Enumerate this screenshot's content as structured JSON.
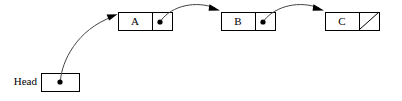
{
  "diagram": {
    "type": "linked-list",
    "colors": {
      "stroke": "#000000",
      "curve": "#444444",
      "background": "#ffffff",
      "dot": "#000000"
    },
    "head": {
      "label": "Head",
      "box": {
        "x": 41,
        "y": 73,
        "width": 38,
        "height": 18
      },
      "dot": {
        "cx": 60,
        "cy": 82,
        "r": 2.6
      },
      "label_pos": {
        "x": 37,
        "y": 82
      }
    },
    "nodes": [
      {
        "id": "node-a",
        "label": "A",
        "box": {
          "x": 118,
          "y": 12,
          "width": 54,
          "height": 18
        },
        "divider_x": 152,
        "data_label_pos": {
          "x": 135,
          "y": 21.5
        },
        "pointer": {
          "type": "dot",
          "cx": 160,
          "cy": 22,
          "r": 2.6
        }
      },
      {
        "id": "node-b",
        "label": "B",
        "box": {
          "x": 221,
          "y": 12,
          "width": 54,
          "height": 18
        },
        "divider_x": 255,
        "data_label_pos": {
          "x": 238,
          "y": 21.5
        },
        "pointer": {
          "type": "dot",
          "cx": 263,
          "cy": 22,
          "r": 2.6
        }
      },
      {
        "id": "node-c",
        "label": "C",
        "box": {
          "x": 325,
          "y": 12,
          "width": 54,
          "height": 18
        },
        "divider_x": 359,
        "data_label_pos": {
          "x": 342,
          "y": 21.5
        },
        "pointer": {
          "type": "null-slash",
          "from": {
            "x": 359,
            "y": 30
          },
          "to": {
            "x": 379,
            "y": 12
          }
        }
      }
    ],
    "links": [
      {
        "id": "link-head-to-a",
        "from": "head",
        "to": "node-a",
        "path": "M 60.5 81 C 62 62 76 30 114 16",
        "arrow": {
          "x": 116.5,
          "y": 14.8,
          "angle": -24
        }
      },
      {
        "id": "link-a-to-b",
        "from": "node-a",
        "to": "node-b",
        "path": "M 161 21 C 172 6 196 1 216 8.5",
        "arrow": {
          "x": 218.8,
          "y": 9.8,
          "angle": 26
        }
      },
      {
        "id": "link-b-to-c",
        "from": "node-b",
        "to": "node-c",
        "path": "M 264 21 C 276 6 300 1 320 8.5",
        "arrow": {
          "x": 322.8,
          "y": 9.8,
          "angle": 26
        }
      }
    ]
  }
}
